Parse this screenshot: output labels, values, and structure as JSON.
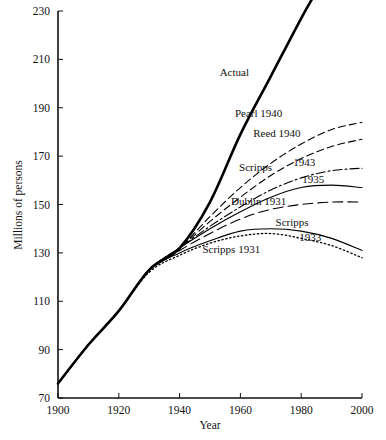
{
  "chart_data": {
    "type": "line",
    "title": "",
    "xlabel": "Year",
    "ylabel": "Millions of persons",
    "xlim": [
      1900,
      2000
    ],
    "ylim": [
      70,
      230
    ],
    "xticks": [
      1900,
      1920,
      1940,
      1960,
      1980,
      2000
    ],
    "yticks": [
      70,
      90,
      110,
      130,
      150,
      170,
      190,
      210,
      230
    ],
    "grid": false,
    "legend_position": "inline-labels",
    "series": [
      {
        "name": "Actual",
        "label": "Actual",
        "style": "solid-thick",
        "x": [
          1900,
          1910,
          1920,
          1930,
          1940,
          1950,
          1960,
          1970,
          1980,
          1985
        ],
        "values": [
          76,
          92,
          106,
          123,
          132,
          151,
          179,
          203,
          227,
          238
        ]
      },
      {
        "name": "Pearl 1940",
        "label": "Pearl 1940",
        "style": "dashed",
        "x": [
          1900,
          1910,
          1920,
          1930,
          1940,
          1950,
          1960,
          1970,
          1980,
          1990,
          2000
        ],
        "values": [
          76,
          92,
          106,
          123,
          132,
          145,
          157,
          167,
          175,
          181,
          184
        ]
      },
      {
        "name": "Reed 1940",
        "label": "Reed 1940",
        "style": "dashed",
        "x": [
          1900,
          1910,
          1920,
          1930,
          1940,
          1950,
          1960,
          1970,
          1980,
          1990,
          2000
        ],
        "values": [
          76,
          92,
          106,
          123,
          132,
          143,
          153,
          162,
          169,
          174,
          177
        ]
      },
      {
        "name": "Scripps 1943",
        "label": "Scripps 1943",
        "style": "dash-dot",
        "x": [
          1900,
          1910,
          1920,
          1930,
          1940,
          1950,
          1960,
          1970,
          1980,
          1990,
          2000
        ],
        "values": [
          76,
          92,
          106,
          123,
          132,
          141,
          149,
          156,
          161,
          164,
          165
        ]
      },
      {
        "name": "Scripps 1935",
        "label": "1935",
        "style": "solid-thin",
        "x": [
          1900,
          1910,
          1920,
          1930,
          1940,
          1950,
          1960,
          1970,
          1980,
          1990,
          2000
        ],
        "values": [
          76,
          92,
          106,
          123,
          132,
          140,
          147,
          153,
          157,
          158,
          157
        ]
      },
      {
        "name": "Dublin 1931",
        "label": "Dublin 1931",
        "style": "dashed-long",
        "x": [
          1900,
          1910,
          1920,
          1930,
          1940,
          1950,
          1960,
          1970,
          1980,
          1990,
          2000
        ],
        "values": [
          76,
          92,
          106,
          123,
          131,
          138,
          144,
          148,
          150,
          151,
          151
        ]
      },
      {
        "name": "Scripps 1933",
        "label": "Scripps 1933",
        "style": "solid-thin",
        "x": [
          1900,
          1910,
          1920,
          1930,
          1940,
          1950,
          1960,
          1970,
          1980,
          1990,
          2000
        ],
        "values": [
          76,
          92,
          106,
          123,
          130,
          135,
          139,
          140,
          139,
          136,
          131
        ]
      },
      {
        "name": "Scripps 1931",
        "label": "Scripps 1931",
        "style": "dotted",
        "x": [
          1900,
          1910,
          1920,
          1930,
          1940,
          1950,
          1960,
          1970,
          1980,
          1990,
          2000
        ],
        "values": [
          76,
          92,
          106,
          122,
          129,
          134,
          137,
          138,
          136,
          133,
          128
        ]
      }
    ],
    "annotations": [
      {
        "text": "Actual",
        "x": 1958,
        "y": 203
      },
      {
        "text": "Pearl 1940",
        "x": 1966,
        "y": 186
      },
      {
        "text": "Reed 1940",
        "x": 1972,
        "y": 178
      },
      {
        "text": "Scripps",
        "x": 1965,
        "y": 164
      },
      {
        "text": "1943",
        "x": 1981,
        "y": 166
      },
      {
        "text": "1935",
        "x": 1984,
        "y": 159
      },
      {
        "text": "Dublin 1931",
        "x": 1966,
        "y": 150
      },
      {
        "text": "Scripps",
        "x": 1977,
        "y": 141
      },
      {
        "text": "1933",
        "x": 1983,
        "y": 135
      },
      {
        "text": "Scripps 1931",
        "x": 1957,
        "y": 130
      }
    ]
  },
  "axes": {
    "y_title": "Millions of persons",
    "x_title": "Year",
    "y_tick_labels": [
      "230",
      "210",
      "190",
      "170",
      "150",
      "130",
      "110",
      "90",
      "70"
    ],
    "x_tick_labels": [
      "1900",
      "1920",
      "1940",
      "1960",
      "1980",
      "2000"
    ]
  },
  "colors": {
    "ink": "#111111",
    "background": "#ffffff"
  }
}
